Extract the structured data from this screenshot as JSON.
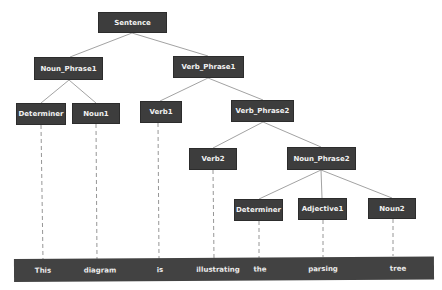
{
  "diagram": {
    "colors": {
      "node_fill": "#3d3d3d",
      "node_text": "#f2f2f2",
      "edge": "#8a8a8a",
      "dash": "#8a8a8a",
      "bar_fill": "#424242",
      "background": "#ffffff"
    },
    "nodes": {
      "sentence": {
        "label": "Sentence"
      },
      "noun_phrase1": {
        "label": "Noun_Phrase1"
      },
      "verb_phrase1": {
        "label": "Verb_Phrase1"
      },
      "determiner1": {
        "label": "Determiner"
      },
      "noun1": {
        "label": "Noun1"
      },
      "verb1": {
        "label": "Verb1"
      },
      "verb_phrase2": {
        "label": "Verb_Phrase2"
      },
      "verb2": {
        "label": "Verb2"
      },
      "noun_phrase2": {
        "label": "Noun_Phrase2"
      },
      "determiner2": {
        "label": "Determiner"
      },
      "adjective1": {
        "label": "Adjective1"
      },
      "noun2": {
        "label": "Noun2"
      }
    },
    "edges": [
      [
        "Sentence",
        "Noun_Phrase1"
      ],
      [
        "Sentence",
        "Verb_Phrase1"
      ],
      [
        "Noun_Phrase1",
        "Determiner"
      ],
      [
        "Noun_Phrase1",
        "Noun1"
      ],
      [
        "Verb_Phrase1",
        "Verb1"
      ],
      [
        "Verb_Phrase1",
        "Verb_Phrase2"
      ],
      [
        "Verb_Phrase2",
        "Verb2"
      ],
      [
        "Verb_Phrase2",
        "Noun_Phrase2"
      ],
      [
        "Noun_Phrase2",
        "Determiner"
      ],
      [
        "Noun_Phrase2",
        "Adjective1"
      ],
      [
        "Noun_Phrase2",
        "Noun2"
      ]
    ],
    "words": [
      "This",
      "diagram",
      "is",
      "illustrating",
      "the",
      "parsing",
      "tree"
    ],
    "word_links": [
      [
        "Determiner",
        "This"
      ],
      [
        "Noun1",
        "diagram"
      ],
      [
        "Verb1",
        "is"
      ],
      [
        "Verb2",
        "illustrating"
      ],
      [
        "Determiner",
        "the"
      ],
      [
        "Adjective1",
        "parsing"
      ],
      [
        "Noun2",
        "tree"
      ]
    ]
  }
}
